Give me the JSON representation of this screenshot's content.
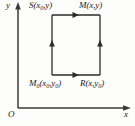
{
  "figure": {
    "type": "geometry-diagram",
    "axes": {
      "x_label": "x",
      "y_label": "y",
      "origin_label": "O",
      "origin_px": {
        "x": 18,
        "y": 108
      },
      "x_axis_end_px": {
        "x": 130,
        "y": 108
      },
      "y_axis_end_px": {
        "x": 18,
        "y": 4
      }
    },
    "rectangle": {
      "left_px": 52,
      "right_px": 100,
      "top_px": 15,
      "bottom_px": 75,
      "stroke": "#2b2b2b",
      "stroke_width": 1.3
    },
    "vertices": [
      {
        "id": "S",
        "label": "S(x",
        "sub1": "0",
        "label_tail": ",y)",
        "corner": "top-left",
        "label_px": {
          "x": 29,
          "y": 1
        }
      },
      {
        "id": "M",
        "label": "M(x,y)",
        "corner": "top-right",
        "label_px": {
          "x": 79,
          "y": 1
        }
      },
      {
        "id": "M0",
        "label": "M",
        "sub1": "0",
        "label_mid": "(x",
        "sub2": "0",
        "label_mid2": ",y",
        "sub3": "0",
        "label_tail": ")",
        "corner": "bottom-left",
        "label_px": {
          "x": 29,
          "y": 79
        }
      },
      {
        "id": "R",
        "label": "R(x,y",
        "sub1": "0",
        "label_tail": ")",
        "corner": "bottom-right",
        "label_px": {
          "x": 80,
          "y": 79
        }
      }
    ],
    "edge_arrows": [
      {
        "edge": "top",
        "direction": "right",
        "at_px": {
          "x": 76,
          "y": 15
        }
      },
      {
        "edge": "bottom",
        "direction": "right",
        "at_px": {
          "x": 76,
          "y": 75
        }
      },
      {
        "edge": "left",
        "direction": "up",
        "at_px": {
          "x": 52,
          "y": 45
        }
      },
      {
        "edge": "right",
        "direction": "up",
        "at_px": {
          "x": 100,
          "y": 45
        }
      }
    ],
    "colors": {
      "background": "#fdfdfc",
      "line": "#2b2b2b",
      "axis": "#3a3a3a",
      "text": "#1a1a1a"
    }
  }
}
